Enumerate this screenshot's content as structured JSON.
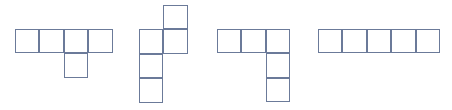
{
  "figure": {
    "canvas": {
      "width": 452,
      "height": 110
    },
    "background_color": "#ffffff",
    "stroke_color": "#6b7a99",
    "fill_color": "#ffffff",
    "stroke_width": 1,
    "cell_size": 24.4,
    "shape_count": 4,
    "total_cells": 19,
    "shapes": [
      {
        "name": "shape-1",
        "label": "L-pentomino variant: row of four with one below third",
        "cell_count": 5,
        "origin": {
          "x": 15,
          "y": 29
        },
        "grid_cells": [
          {
            "col": 0,
            "row": 0
          },
          {
            "col": 1,
            "row": 0
          },
          {
            "col": 2,
            "row": 0
          },
          {
            "col": 3,
            "row": 0
          },
          {
            "col": 2,
            "row": 1
          }
        ],
        "bounds": {
          "x": 15,
          "y": 29,
          "width": 97.6,
          "height": 48.8
        }
      },
      {
        "name": "shape-2",
        "label": "Vertical column of three with one attached upper right and one above",
        "cell_count": 5,
        "origin": {
          "x": 139,
          "y": 5
        },
        "grid_cells": [
          {
            "col": 1,
            "row": 0
          },
          {
            "col": 0,
            "row": 1
          },
          {
            "col": 1,
            "row": 1
          },
          {
            "col": 0,
            "row": 2
          },
          {
            "col": 0,
            "row": 3
          }
        ],
        "bounds": {
          "x": 139,
          "y": 5,
          "width": 48.8,
          "height": 97.6
        }
      },
      {
        "name": "shape-3",
        "label": "L-shape: top row of three with two below rightmost",
        "cell_count": 5,
        "origin": {
          "x": 217,
          "y": 29
        },
        "grid_cells": [
          {
            "col": 0,
            "row": 0
          },
          {
            "col": 1,
            "row": 0
          },
          {
            "col": 2,
            "row": 0
          },
          {
            "col": 2,
            "row": 1
          },
          {
            "col": 2,
            "row": 2
          }
        ],
        "bounds": {
          "x": 217,
          "y": 29,
          "width": 73.2,
          "height": 73.2
        }
      },
      {
        "name": "shape-4",
        "label": "Straight pentomino: horizontal row of five",
        "cell_count": 5,
        "origin": {
          "x": 318,
          "y": 29
        },
        "grid_cells": [
          {
            "col": 0,
            "row": 0
          },
          {
            "col": 1,
            "row": 0
          },
          {
            "col": 2,
            "row": 0
          },
          {
            "col": 3,
            "row": 0
          },
          {
            "col": 4,
            "row": 0
          }
        ],
        "bounds": {
          "x": 318,
          "y": 29,
          "width": 122,
          "height": 24.4
        }
      }
    ]
  }
}
